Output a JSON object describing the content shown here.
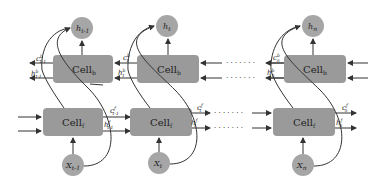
{
  "diagram": {
    "type": "bidirectional-lstm",
    "colors": {
      "cell_fill": "#9a9a9a",
      "node_fill": "#a6a6a6",
      "arrow": "#333333",
      "background": "#ffffff"
    },
    "columns": [
      {
        "id": "t-1",
        "output": {
          "base": "h",
          "sub": "t-1"
        },
        "backward_cell": {
          "base": "Cell",
          "sub": "b"
        },
        "forward_cell": {
          "base": "Cell",
          "sub": "f"
        },
        "input": {
          "base": "X",
          "sub": "t-1"
        },
        "backward_c": {
          "base": "c",
          "sup": "b",
          "sub": "t-1"
        },
        "backward_h": {
          "base": "h",
          "sup": "b",
          "sub": "t-1"
        },
        "forward_c": {
          "base": "c",
          "sup": "f",
          "sub": "t-1"
        },
        "forward_h": {
          "base": "h",
          "sup": "f",
          "sub": "t-1"
        }
      },
      {
        "id": "t",
        "output": {
          "base": "h",
          "sub": "t"
        },
        "backward_cell": {
          "base": "Cell",
          "sub": "b"
        },
        "forward_cell": {
          "base": "Cell",
          "sub": "f"
        },
        "input": {
          "base": "X",
          "sub": "t"
        },
        "backward_c": {
          "base": "c",
          "sup": "b",
          "sub": "t"
        },
        "backward_h": {
          "base": "h",
          "sup": "b",
          "sub": "t"
        },
        "forward_c": {
          "base": "c",
          "sup": "f",
          "sub": "t"
        },
        "forward_h": {
          "base": "h",
          "sup": "f",
          "sub": "t"
        }
      },
      {
        "id": "n",
        "output": {
          "base": "h",
          "sub": "n"
        },
        "backward_cell": {
          "base": "Cell",
          "sub": "b"
        },
        "forward_cell": {
          "base": "Cell",
          "sub": "f"
        },
        "input": {
          "base": "X",
          "sub": "n"
        },
        "backward_c": {
          "base": "c",
          "sup": "b",
          "sub": "n"
        },
        "backward_h": {
          "base": "h",
          "sup": "b",
          "sub": "n"
        },
        "forward_c": {
          "base": "c",
          "sup": "f",
          "sub": "n"
        },
        "forward_h": {
          "base": "h",
          "sup": "f",
          "sub": "n"
        }
      }
    ],
    "ellipsis": "· · · · · · ·"
  }
}
